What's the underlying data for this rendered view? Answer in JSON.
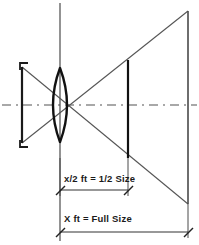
{
  "figure": {
    "type": "optical-ray-diagram",
    "width": 199,
    "height": 245,
    "background_color": "#ffffff",
    "line_color": "#3a3a3a",
    "heavy_line_color": "#1a1a1a",
    "axis_color": "#8c8c8c"
  },
  "labels": {
    "half_size": "x/2 ft = 1/2 Size",
    "full_size": "X ft = Full Size"
  },
  "elements": {
    "object_name": "object-bracket",
    "lens_name": "convex-lens",
    "lens_axis_name": "lens-vertical-axis",
    "optical_axis_name": "optical-axis-centerline",
    "image_half_name": "image-plane-half-size",
    "image_full_name": "image-plane-full-size",
    "ray_upper_name": "ray-upper-crossing",
    "ray_lower_name": "ray-lower-crossing"
  },
  "geometry": {
    "optical_axis_y": 105,
    "lens_axis_x": 60,
    "object_x": 22,
    "object_top_y": 67,
    "object_bottom_y": 143,
    "lens_center_x": 60,
    "lens_half_height": 37,
    "lens_half_width": 12,
    "half_plane_x": 128,
    "half_plane_top_y": 60,
    "half_plane_bottom_y": 158,
    "full_plane_x": 188,
    "full_plane_top_y": 11,
    "full_plane_bottom_y": 204,
    "dim_half_y": 190,
    "dim_full_y": 232,
    "dim_left_x": 60,
    "dim_half_right_x": 128,
    "dim_full_right_x": 188
  }
}
